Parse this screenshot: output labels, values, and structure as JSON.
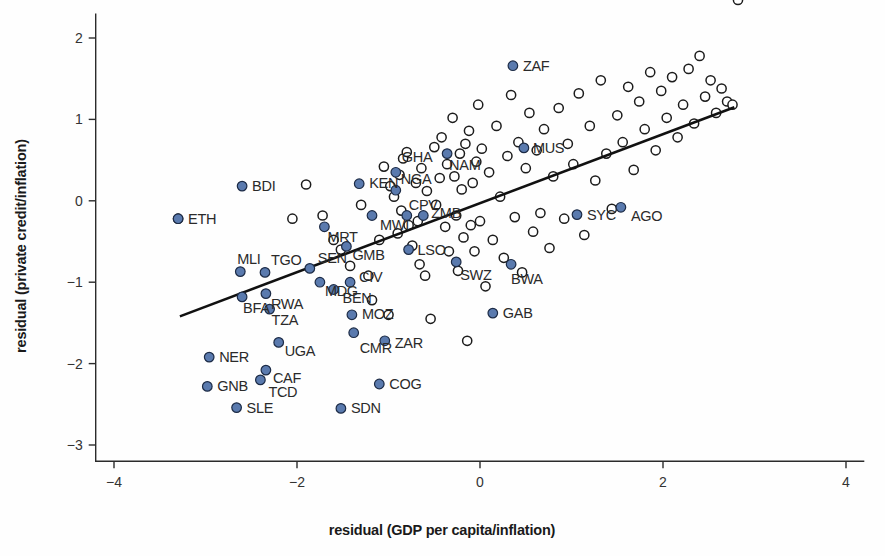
{
  "chart_data": {
    "type": "scatter",
    "title": "",
    "xlabel": "residual (GDP per capita/inflation)",
    "ylabel": "residual (private credit/inflation)",
    "xlim": [
      -4.2,
      4.2
    ],
    "ylim": [
      -3.2,
      2.3
    ],
    "xticks": [
      -4,
      -2,
      0,
      2,
      4
    ],
    "xtick_labels": [
      "−4",
      "−2",
      "0",
      "2",
      "4"
    ],
    "yticks": [
      2,
      1,
      0,
      -1,
      -2,
      -3
    ],
    "ytick_labels": [
      "2",
      "1",
      "0",
      "−1",
      "−2",
      "−3"
    ],
    "grid": false,
    "legend": "none",
    "marker_fill_color": "#5a7aae",
    "marker_open_color": "#ffffff",
    "marker_edge_color": "#1c1c1c",
    "fit_line": {
      "label": "linear fit",
      "x0": -3.28,
      "y0": -1.42,
      "x1": 2.78,
      "y1": 1.15,
      "slope": 0.424,
      "intercept": -0.03
    },
    "labelled_series": {
      "name": "African countries (highlighted)",
      "points": [
        {
          "label": "ETH",
          "x": -3.3,
          "y": -0.22,
          "lx": 10,
          "ly": 5
        },
        {
          "label": "BDI",
          "x": -2.6,
          "y": 0.18,
          "lx": 10,
          "ly": 5
        },
        {
          "label": "MLI",
          "x": -2.62,
          "y": -0.87,
          "lx": -3,
          "ly": -8
        },
        {
          "label": "TGO",
          "x": -2.35,
          "y": -0.88,
          "lx": 6,
          "ly": -7
        },
        {
          "label": "BFA",
          "x": -2.6,
          "y": -1.18,
          "lx": 1,
          "ly": 16
        },
        {
          "label": "RWA",
          "x": -2.34,
          "y": -1.14,
          "lx": 5,
          "ly": 15
        },
        {
          "label": "TZA",
          "x": -2.3,
          "y": -1.33,
          "lx": 2,
          "ly": 16
        },
        {
          "label": "NER",
          "x": -2.96,
          "y": -1.92,
          "lx": 10,
          "ly": 5
        },
        {
          "label": "UGA",
          "x": -2.2,
          "y": -1.74,
          "lx": 6,
          "ly": 14
        },
        {
          "label": "CAF",
          "x": -2.34,
          "y": -2.08,
          "lx": 7,
          "ly": 13
        },
        {
          "label": "GNB",
          "x": -2.98,
          "y": -2.28,
          "lx": 10,
          "ly": 5
        },
        {
          "label": "TCD",
          "x": -2.4,
          "y": -2.2,
          "lx": 8,
          "ly": 17
        },
        {
          "label": "SLE",
          "x": -2.66,
          "y": -2.54,
          "lx": 10,
          "ly": 5
        },
        {
          "label": "SEN",
          "x": -1.86,
          "y": -0.83,
          "lx": 8,
          "ly": -5
        },
        {
          "label": "MDG",
          "x": -1.75,
          "y": -1.0,
          "lx": 5,
          "ly": 14
        },
        {
          "label": "MRT",
          "x": -1.7,
          "y": -0.32,
          "lx": 3,
          "ly": 15
        },
        {
          "label": "BEN",
          "x": -1.6,
          "y": -1.09,
          "lx": 9,
          "ly": 13
        },
        {
          "label": "CIV",
          "x": -1.42,
          "y": -1.0,
          "lx": 9,
          "ly": 0
        },
        {
          "label": "GMB",
          "x": -1.46,
          "y": -0.56,
          "lx": 6,
          "ly": 14
        },
        {
          "label": "KEN",
          "x": -1.32,
          "y": 0.21,
          "lx": 10,
          "ly": 4
        },
        {
          "label": "MWI",
          "x": -1.18,
          "y": -0.18,
          "lx": 8,
          "ly": 14
        },
        {
          "label": "MOZ",
          "x": -1.4,
          "y": -1.4,
          "lx": 10,
          "ly": 4
        },
        {
          "label": "CMR",
          "x": -1.38,
          "y": -1.62,
          "lx": 6,
          "ly": 20
        },
        {
          "label": "ZAR",
          "x": -1.04,
          "y": -1.72,
          "lx": 10,
          "ly": 7
        },
        {
          "label": "COG",
          "x": -1.1,
          "y": -2.25,
          "lx": 10,
          "ly": 5
        },
        {
          "label": "SDN",
          "x": -1.52,
          "y": -2.55,
          "lx": 10,
          "ly": 5
        },
        {
          "label": "LSO",
          "x": -0.78,
          "y": -0.6,
          "lx": 9,
          "ly": 5
        },
        {
          "label": "NGA",
          "x": -0.92,
          "y": 0.13,
          "lx": 5,
          "ly": -6
        },
        {
          "label": "CPV",
          "x": -0.8,
          "y": -0.18,
          "lx": 2,
          "ly": -6
        },
        {
          "label": "GHA",
          "x": -0.92,
          "y": 0.35,
          "lx": 6,
          "ly": -10
        },
        {
          "label": "ZMB",
          "x": -0.62,
          "y": -0.18,
          "lx": 8,
          "ly": 2
        },
        {
          "label": "NAM",
          "x": -0.36,
          "y": 0.58,
          "lx": 2,
          "ly": 16
        },
        {
          "label": "ZAF",
          "x": 0.36,
          "y": 1.66,
          "lx": 10,
          "ly": 5
        },
        {
          "label": "MUS",
          "x": 0.48,
          "y": 0.65,
          "lx": 9,
          "ly": 5
        },
        {
          "label": "SWZ",
          "x": -0.26,
          "y": -0.75,
          "lx": 4,
          "ly": 18
        },
        {
          "label": "BWA",
          "x": 0.34,
          "y": -0.78,
          "lx": 0,
          "ly": 20
        },
        {
          "label": "SYC",
          "x": 1.06,
          "y": -0.17,
          "lx": 10,
          "ly": 5
        },
        {
          "label": "AGO",
          "x": 1.54,
          "y": -0.08,
          "lx": 10,
          "ly": 14
        },
        {
          "label": "GAB",
          "x": 0.14,
          "y": -1.38,
          "lx": 10,
          "ly": 5
        }
      ]
    },
    "background_series": {
      "name": "other countries",
      "x": [
        -3.3,
        -2.05,
        -1.9,
        -1.72,
        -1.6,
        -1.52,
        -1.42,
        -1.3,
        -1.22,
        -1.18,
        -1.1,
        -1.05,
        -1.0,
        -0.98,
        -0.94,
        -0.9,
        -0.88,
        -0.86,
        -0.84,
        -0.8,
        -0.78,
        -0.74,
        -0.7,
        -0.68,
        -0.66,
        -0.64,
        -0.6,
        -0.58,
        -0.54,
        -0.5,
        -0.48,
        -0.44,
        -0.42,
        -0.38,
        -0.36,
        -0.34,
        -0.3,
        -0.28,
        -0.26,
        -0.24,
        -0.22,
        -0.2,
        -0.18,
        -0.16,
        -0.14,
        -0.12,
        -0.1,
        -0.08,
        -0.06,
        -0.04,
        -0.02,
        0.0,
        0.02,
        0.06,
        0.1,
        0.14,
        0.18,
        0.22,
        0.26,
        0.3,
        0.34,
        0.38,
        0.42,
        0.46,
        0.5,
        0.54,
        0.58,
        0.62,
        0.66,
        0.7,
        0.76,
        0.8,
        0.86,
        0.92,
        0.96,
        1.02,
        1.08,
        1.14,
        1.2,
        1.26,
        1.32,
        1.38,
        1.44,
        1.5,
        1.56,
        1.62,
        1.68,
        1.74,
        1.8,
        1.86,
        1.92,
        1.98,
        2.04,
        2.1,
        2.16,
        2.22,
        2.28,
        2.34,
        2.4,
        2.46,
        2.52,
        2.58,
        2.64,
        2.7,
        2.76,
        2.82
      ],
      "y": [
        -0.22,
        -0.22,
        0.2,
        -0.18,
        -0.48,
        -0.6,
        -0.8,
        -0.05,
        -0.92,
        -1.22,
        -0.48,
        0.42,
        -1.4,
        0.18,
        0.05,
        -0.4,
        0.32,
        -0.12,
        0.52,
        0.6,
        -0.3,
        -0.55,
        0.22,
        -0.25,
        -0.78,
        0.4,
        -0.92,
        0.12,
        -1.45,
        0.66,
        -0.05,
        0.28,
        0.78,
        -0.32,
        0.45,
        -0.62,
        1.02,
        0.3,
        -0.18,
        -0.86,
        0.58,
        0.14,
        -0.45,
        0.7,
        -1.72,
        0.86,
        -0.3,
        0.22,
        -0.62,
        0.48,
        1.18,
        -0.25,
        0.64,
        -1.05,
        0.35,
        -0.48,
        0.92,
        0.05,
        -0.7,
        0.55,
        1.3,
        -0.2,
        0.72,
        -0.88,
        0.4,
        1.08,
        -0.38,
        0.62,
        -0.15,
        0.88,
        -0.58,
        0.3,
        1.14,
        -0.22,
        0.7,
        0.45,
        1.32,
        -0.42,
        0.92,
        0.25,
        1.48,
        0.58,
        -0.1,
        1.05,
        0.72,
        1.4,
        0.38,
        1.22,
        0.88,
        1.58,
        0.62,
        1.35,
        1.02,
        1.52,
        0.78,
        1.18,
        1.62,
        0.95,
        1.78,
        1.28,
        1.48,
        1.08,
        1.38,
        1.22,
        1.18
      ]
    }
  },
  "figure": {
    "background_color": "#ffffff",
    "axis_color": "#2b2b2b",
    "fit_line_color": "#111111"
  }
}
